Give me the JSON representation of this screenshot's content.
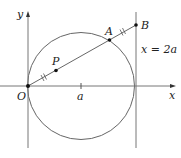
{
  "diagram": {
    "axes": {
      "x_label": "x",
      "y_label": "y",
      "origin_label": "O",
      "tick_label": "a"
    },
    "points": {
      "O": "O",
      "P": "P",
      "A": "A",
      "B": "B"
    },
    "line_label": "x = 2a",
    "colors": {
      "stroke": "#555555",
      "point": "#111111",
      "text": "#222222"
    }
  }
}
